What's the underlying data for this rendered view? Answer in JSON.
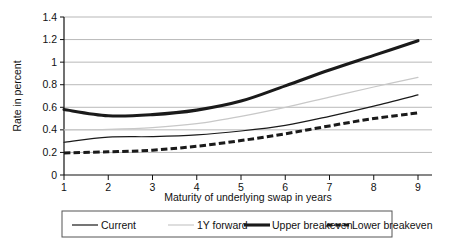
{
  "chart_data": {
    "type": "line",
    "title": "",
    "subtitle": "",
    "xlabel": "Maturity of underlying swap in years",
    "ylabel": "Rate in percent",
    "x": [
      1,
      2,
      3,
      4,
      5,
      6,
      7,
      8,
      9
    ],
    "xlim": [
      1,
      9
    ],
    "ylim": [
      0,
      1.4
    ],
    "xticks": [
      "1",
      "2",
      "3",
      "4",
      "5",
      "6",
      "7",
      "8",
      "9"
    ],
    "yticks": [
      "0",
      "0.2",
      "0.4",
      "0.6",
      "0.8",
      "1",
      "1.2",
      "1.4"
    ],
    "ytick_values": [
      0,
      0.2,
      0.4,
      0.6,
      0.8,
      1.0,
      1.2,
      1.4
    ],
    "grid": true,
    "grid_axis": "y",
    "legend_position": "bottom",
    "series": [
      {
        "name": "Current",
        "values": [
          0.29,
          0.335,
          0.34,
          0.355,
          0.39,
          0.44,
          0.52,
          0.61,
          0.71
        ],
        "color": "#1a1a1a",
        "style": "solid",
        "width": 1.2
      },
      {
        "name": "1Y forward",
        "values": [
          0.4,
          0.405,
          0.42,
          0.455,
          0.52,
          0.6,
          0.69,
          0.78,
          0.865
        ],
        "color": "#c8c8c8",
        "style": "solid",
        "width": 1.2
      },
      {
        "name": "Upper breakeven",
        "values": [
          0.58,
          0.525,
          0.535,
          0.575,
          0.655,
          0.79,
          0.93,
          1.06,
          1.19
        ],
        "color": "#1a1a1a",
        "style": "solid",
        "width": 3.1
      },
      {
        "name": "Lower breakeven",
        "values": [
          0.195,
          0.205,
          0.22,
          0.255,
          0.305,
          0.365,
          0.435,
          0.5,
          0.55
        ],
        "color": "#1a1a1a",
        "style": "dashed",
        "width": 3.0
      }
    ]
  }
}
